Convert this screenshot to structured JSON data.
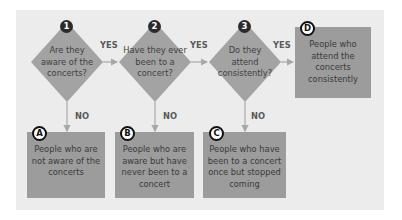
{
  "decisions": [
    {
      "number": "1",
      "question": "Are they aware of the concerts?"
    },
    {
      "number": "2",
      "question": "Have they ever been to a concert?"
    },
    {
      "number": "3",
      "question": "Do they attend consistently?"
    }
  ],
  "outcomes": [
    {
      "letter": "A",
      "text": "People who are not aware of the concerts"
    },
    {
      "letter": "B",
      "text": "People who are aware but have never been to a concert"
    },
    {
      "letter": "C",
      "text": "People who have been to a concert once but stopped coming"
    },
    {
      "letter": "D",
      "text": "People who attend the concerts consistently"
    }
  ],
  "labels": {
    "yes": "YES",
    "no": "NO"
  },
  "colors": {
    "panel": "#ececec",
    "shape": "#9c9c9c",
    "arrow": "#a8a8a8",
    "badge": "#2b2b2b"
  }
}
